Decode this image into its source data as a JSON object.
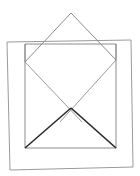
{
  "figure": {
    "canvas": {
      "width": 140,
      "height": 176,
      "background": "#ffffff"
    },
    "colors": {
      "outline_light": "#9a9a9a",
      "outline_medium": "#8c8c8c",
      "outline_dark": "#2b2b2b",
      "background": "#ffffff"
    },
    "stroke_widths": {
      "outer_rectangle": 1.0,
      "inner_square": 1.0,
      "roof": 1.0,
      "light_diagonal": 1.0,
      "dark_flap": 1.6
    },
    "shapes": [
      {
        "name": "outer-rectangle",
        "type": "polygon",
        "stroke": "#9a9a9a",
        "points": "7,42 131,40 133,167 10,170"
      },
      {
        "name": "inner-square",
        "type": "polygon",
        "stroke": "#8c8c8c",
        "points": "25,44 116,44 116,148 25,148"
      },
      {
        "name": "roof-triangle",
        "type": "polyline",
        "stroke": "#8c8c8c",
        "points": "25,62 71,13 116,60"
      },
      {
        "name": "roof-left-lower-edge",
        "type": "line",
        "stroke": "#8c8c8c",
        "x1": 25,
        "y1": 44,
        "x2": 25,
        "y2": 62
      },
      {
        "name": "roof-right-lower-edge",
        "type": "line",
        "stroke": "#8c8c8c",
        "x1": 116,
        "y1": 44,
        "x2": 116,
        "y2": 60
      },
      {
        "name": "light-diagonal-left",
        "type": "line",
        "stroke": "#9a9a9a",
        "x1": 25,
        "y1": 62,
        "x2": 82,
        "y2": 122
      },
      {
        "name": "light-diagonal-right",
        "type": "line",
        "stroke": "#9a9a9a",
        "x1": 116,
        "y1": 60,
        "x2": 60,
        "y2": 122
      },
      {
        "name": "dark-flap-left",
        "type": "line",
        "stroke": "#2b2b2b",
        "x1": 25,
        "y1": 148,
        "x2": 71,
        "y2": 108
      },
      {
        "name": "dark-flap-right",
        "type": "line",
        "stroke": "#2b2b2b",
        "x1": 71,
        "y1": 108,
        "x2": 116,
        "y2": 148
      }
    ],
    "vertices": {
      "apex": {
        "x": 71,
        "y": 13
      },
      "left_wing": {
        "x": 25,
        "y": 62
      },
      "right_wing": {
        "x": 116,
        "y": 60
      },
      "crossing_point": {
        "x": 71,
        "y": 108
      },
      "square_bottom_left": {
        "x": 25,
        "y": 148
      },
      "square_bottom_right": {
        "x": 116,
        "y": 148
      }
    }
  }
}
